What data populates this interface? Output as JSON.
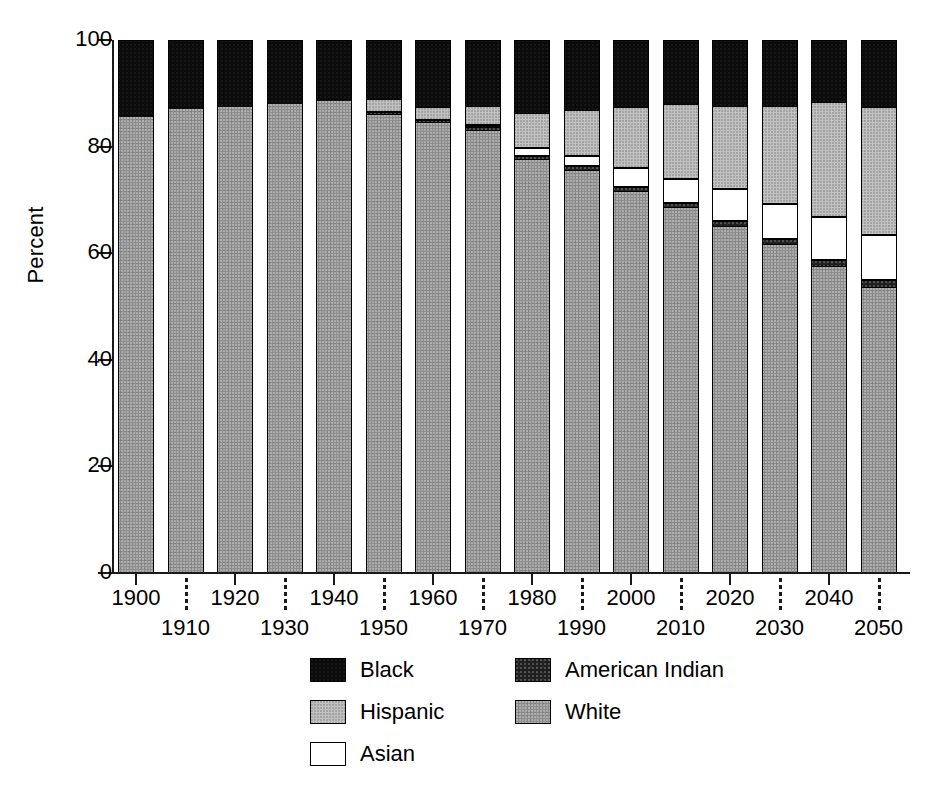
{
  "chart_data": {
    "type": "bar",
    "subtype": "stacked-bar-100-percent",
    "title": "",
    "xlabel": "",
    "ylabel": "Percent",
    "ylim": [
      0,
      100
    ],
    "yticks": [
      0,
      20,
      40,
      60,
      80,
      100
    ],
    "ytick_labels": [
      "0",
      "20",
      "40",
      "60",
      "80",
      "100"
    ],
    "grid": false,
    "legend_position": "bottom-center",
    "categories": [
      "1900",
      "1910",
      "1920",
      "1930",
      "1940",
      "1950",
      "1960",
      "1970",
      "1980",
      "1990",
      "2000",
      "2010",
      "2020",
      "2030",
      "2040",
      "2050"
    ],
    "stack_order_bottom_to_top": [
      "White",
      "American Indian",
      "Asian",
      "Hispanic",
      "Black"
    ],
    "series": [
      {
        "name": "White",
        "color": "#8e8e8e",
        "values": [
          85.5,
          87.0,
          87.5,
          88.0,
          88.5,
          86.0,
          84.5,
          83.0,
          77.5,
          75.5,
          71.5,
          68.5,
          65.0,
          61.5,
          57.5,
          53.5
        ]
      },
      {
        "name": "American Indian",
        "color": "#1f1f1f",
        "values": [
          0.0,
          0.0,
          0.0,
          0.0,
          0.0,
          0.5,
          0.5,
          0.6,
          0.8,
          0.8,
          0.9,
          1.0,
          1.1,
          1.2,
          1.3,
          1.4
        ]
      },
      {
        "name": "Asian",
        "color": "#ffffff",
        "values": [
          0.0,
          0.0,
          0.0,
          0.0,
          0.0,
          0.0,
          0.0,
          0.5,
          1.5,
          2.0,
          3.5,
          4.5,
          6.0,
          6.5,
          8.0,
          8.5
        ]
      },
      {
        "name": "Hispanic",
        "color": "#c3c3c3",
        "values": [
          0.0,
          0.0,
          0.0,
          0.0,
          0.0,
          2.5,
          2.5,
          3.5,
          6.5,
          8.5,
          11.5,
          14.0,
          15.5,
          18.5,
          21.5,
          24.0
        ]
      },
      {
        "name": "Black",
        "color": "#0b0b0b",
        "values": [
          14.5,
          13.0,
          12.5,
          12.0,
          11.5,
          11.0,
          12.5,
          12.4,
          13.7,
          13.2,
          12.6,
          12.0,
          12.4,
          12.3,
          11.7,
          12.6
        ]
      }
    ],
    "legend": [
      {
        "label": "Black",
        "swatch": "fill-black"
      },
      {
        "label": "American Indian",
        "swatch": "fill-amerindian"
      },
      {
        "label": "Hispanic",
        "swatch": "fill-hispanic"
      },
      {
        "label": "White",
        "swatch": "fill-white"
      },
      {
        "label": "Asian",
        "swatch": "fill-asian"
      }
    ]
  }
}
